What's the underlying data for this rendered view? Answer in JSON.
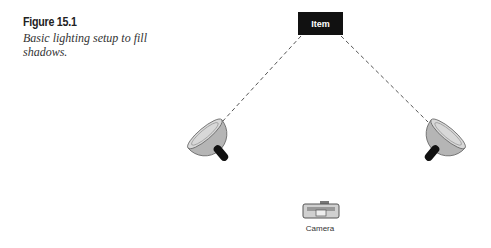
{
  "figure": {
    "label": "Figure 15.1",
    "caption": "Basic lighting setup to fill shadows."
  },
  "diagram": {
    "item_label": "Item",
    "camera_label": "Camera",
    "colors": {
      "item_box": "#111111",
      "light_body": "#b8b8b8",
      "handle": "#111111",
      "line": "#555555"
    }
  }
}
